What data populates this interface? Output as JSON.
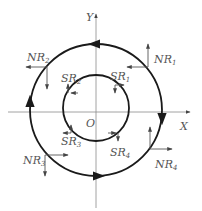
{
  "diagram": {
    "type": "coordinate-circle-diagram",
    "axes": {
      "x_label": "X",
      "y_label": "Y",
      "origin_label": "O"
    },
    "circles": [
      {
        "name": "outer-circle",
        "radius": 66,
        "direction": "counterclockwise"
      },
      {
        "name": "inner-circle",
        "radius": 33,
        "direction": "clockwise"
      }
    ],
    "outer_labels": [
      {
        "id": "NR1",
        "base": "NR",
        "sub": "1",
        "quadrant": "I"
      },
      {
        "id": "NR2",
        "base": "NR",
        "sub": "2",
        "quadrant": "II"
      },
      {
        "id": "NR3",
        "base": "NR",
        "sub": "3",
        "quadrant": "III"
      },
      {
        "id": "NR4",
        "base": "NR",
        "sub": "4",
        "quadrant": "IV"
      }
    ],
    "inner_labels": [
      {
        "id": "SR1",
        "base": "SR",
        "sub": "1",
        "quadrant": "I"
      },
      {
        "id": "SR2",
        "base": "SR",
        "sub": "2",
        "quadrant": "II"
      },
      {
        "id": "SR3",
        "base": "SR",
        "sub": "3",
        "quadrant": "III"
      },
      {
        "id": "SR4",
        "base": "SR",
        "sub": "4",
        "quadrant": "IV"
      }
    ],
    "colors": {
      "circle": "#1a1a1a",
      "axis": "#8a8a8a",
      "text": "#555555"
    }
  }
}
